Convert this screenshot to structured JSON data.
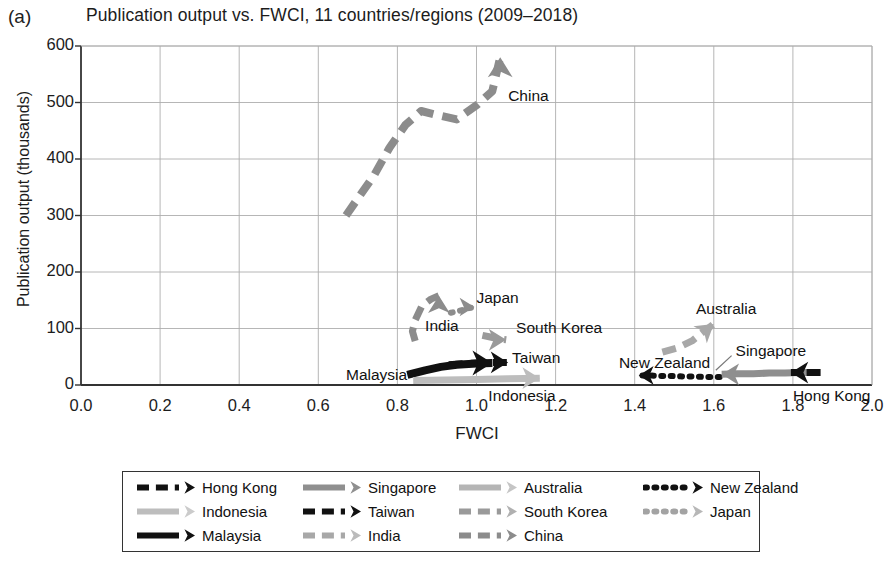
{
  "panel": {
    "letter": "(a)"
  },
  "chart_data": {
    "type": "scatter",
    "title": "Publication output vs. FWCI, 11 countries/regions (2009–2018)",
    "xlabel": "FWCI",
    "ylabel": "Publication output (thousands)",
    "xlim": [
      0.0,
      2.0
    ],
    "ylim": [
      0,
      600
    ],
    "xticks": [
      "0.0",
      "0.2",
      "0.4",
      "0.6",
      "0.8",
      "1.0",
      "1.2",
      "1.4",
      "1.6",
      "1.8",
      "2.0"
    ],
    "yticks": [
      "0",
      "100",
      "200",
      "300",
      "400",
      "500",
      "600"
    ],
    "grid": true,
    "legend_position": "below",
    "note": "Each series is a 2009-2018 trajectory drawn as an arrow; x = FWCI, y = publication output in thousands.",
    "series": [
      {
        "name": "China",
        "color": "#8c8c8c",
        "style": "dashed",
        "arrow": "up",
        "points": [
          [
            0.67,
            300
          ],
          [
            0.7,
            330
          ],
          [
            0.74,
            370
          ],
          [
            0.78,
            420
          ],
          [
            0.82,
            460
          ],
          [
            0.86,
            485
          ],
          [
            0.9,
            478
          ],
          [
            0.95,
            470
          ],
          [
            1.0,
            495
          ],
          [
            1.04,
            520
          ],
          [
            1.06,
            580
          ]
        ]
      },
      {
        "name": "India",
        "color": "#8c8c8c",
        "style": "dashed",
        "arrow": "up",
        "points": [
          [
            0.845,
            78
          ],
          [
            0.838,
            95
          ],
          [
            0.845,
            115
          ],
          [
            0.862,
            140
          ],
          [
            0.885,
            152
          ],
          [
            0.905,
            158
          ]
        ]
      },
      {
        "name": "Japan",
        "color": "#8c8c8c",
        "style": "dotted",
        "arrow": "right",
        "points": [
          [
            0.935,
            128
          ],
          [
            0.95,
            130
          ],
          [
            0.965,
            133
          ],
          [
            0.98,
            136
          ],
          [
            0.995,
            138
          ]
        ]
      },
      {
        "name": "South Korea",
        "color": "#9a9a9a",
        "style": "dashed",
        "arrow": "right",
        "points": [
          [
            1.015,
            88
          ],
          [
            1.035,
            85
          ],
          [
            1.055,
            82
          ],
          [
            1.075,
            80
          ]
        ]
      },
      {
        "name": "Taiwan",
        "color": "#111111",
        "style": "dashed",
        "arrow": "right",
        "points": [
          [
            0.93,
            36
          ],
          [
            0.97,
            38
          ],
          [
            1.01,
            39
          ],
          [
            1.05,
            40
          ],
          [
            1.08,
            40
          ]
        ]
      },
      {
        "name": "Malaysia",
        "color": "#111111",
        "style": "solid",
        "arrow": "right",
        "points": [
          [
            0.825,
            18
          ],
          [
            0.87,
            26
          ],
          [
            0.91,
            32
          ],
          [
            0.95,
            36
          ],
          [
            1.0,
            38
          ],
          [
            1.04,
            39
          ]
        ]
      },
      {
        "name": "Indonesia",
        "color": "#bdbdbd",
        "style": "solid",
        "arrow": "right",
        "points": [
          [
            0.84,
            8
          ],
          [
            0.92,
            9
          ],
          [
            1.0,
            10
          ],
          [
            1.08,
            11
          ],
          [
            1.16,
            12
          ]
        ]
      },
      {
        "name": "Australia",
        "color": "#a8a8a8",
        "style": "dashed",
        "arrow": "up-right",
        "points": [
          [
            1.47,
            58
          ],
          [
            1.51,
            66
          ],
          [
            1.545,
            78
          ],
          [
            1.57,
            92
          ],
          [
            1.6,
            108
          ]
        ]
      },
      {
        "name": "New Zealand",
        "color": "#111111",
        "style": "dotted",
        "arrow": "left",
        "points": [
          [
            1.615,
            14
          ],
          [
            1.585,
            14
          ],
          [
            1.555,
            15
          ],
          [
            1.525,
            15
          ],
          [
            1.495,
            16
          ],
          [
            1.465,
            16
          ],
          [
            1.435,
            17
          ],
          [
            1.41,
            17
          ]
        ]
      },
      {
        "name": "Singapore",
        "color": "#8f8f8f",
        "style": "solid",
        "arrow": "left",
        "points": [
          [
            1.86,
            22
          ],
          [
            1.82,
            22
          ],
          [
            1.78,
            21
          ],
          [
            1.74,
            21
          ],
          [
            1.7,
            20
          ],
          [
            1.66,
            20
          ],
          [
            1.62,
            19
          ]
        ]
      },
      {
        "name": "Hong Kong",
        "color": "#111111",
        "style": "dashed",
        "arrow": "left",
        "points": [
          [
            1.87,
            22
          ],
          [
            1.845,
            22
          ],
          [
            1.82,
            22
          ],
          [
            1.795,
            22
          ]
        ]
      }
    ],
    "annotations": [
      {
        "text": "China",
        "x": 1.08,
        "y": 510
      },
      {
        "text": "Japan",
        "x": 1.0,
        "y": 152
      },
      {
        "text": "India",
        "x": 0.87,
        "y": 102
      },
      {
        "text": "South Korea",
        "x": 1.1,
        "y": 100
      },
      {
        "text": "Australia",
        "x": 1.555,
        "y": 132
      },
      {
        "text": "Taiwan",
        "x": 1.09,
        "y": 46
      },
      {
        "text": "Singapore",
        "x": 1.655,
        "y": 58
      },
      {
        "text": "New Zealand",
        "x": 1.36,
        "y": 38
      },
      {
        "text": "Malaysia",
        "x": 0.67,
        "y": 16
      },
      {
        "text": "Indonesia",
        "x": 1.03,
        "y": -22
      },
      {
        "text": "Hong Kong",
        "x": 1.8,
        "y": -22
      }
    ]
  },
  "legend": {
    "items": [
      {
        "label": "Hong Kong",
        "color": "#111111",
        "style": "dashed",
        "head": "solid"
      },
      {
        "label": "Singapore",
        "color": "#8f8f8f",
        "style": "solid",
        "head": "solid"
      },
      {
        "label": "Australia",
        "color": "#b5b5b5",
        "style": "solid",
        "head": "open"
      },
      {
        "label": "New Zealand",
        "color": "#111111",
        "style": "dotted",
        "head": "solid"
      },
      {
        "label": "Indonesia",
        "color": "#bdbdbd",
        "style": "solid",
        "head": "open"
      },
      {
        "label": "Taiwan",
        "color": "#111111",
        "style": "dashed",
        "head": "solid"
      },
      {
        "label": "South Korea",
        "color": "#9a9a9a",
        "style": "dashed",
        "head": "open"
      },
      {
        "label": "Japan",
        "color": "#a3a3a3",
        "style": "dotted",
        "head": "open"
      },
      {
        "label": "Malaysia",
        "color": "#111111",
        "style": "solid",
        "head": "solid"
      },
      {
        "label": "India",
        "color": "#a8a8a8",
        "style": "dashed",
        "head": "open"
      },
      {
        "label": "China",
        "color": "#8c8c8c",
        "style": "dashed",
        "head": "solid"
      }
    ]
  }
}
